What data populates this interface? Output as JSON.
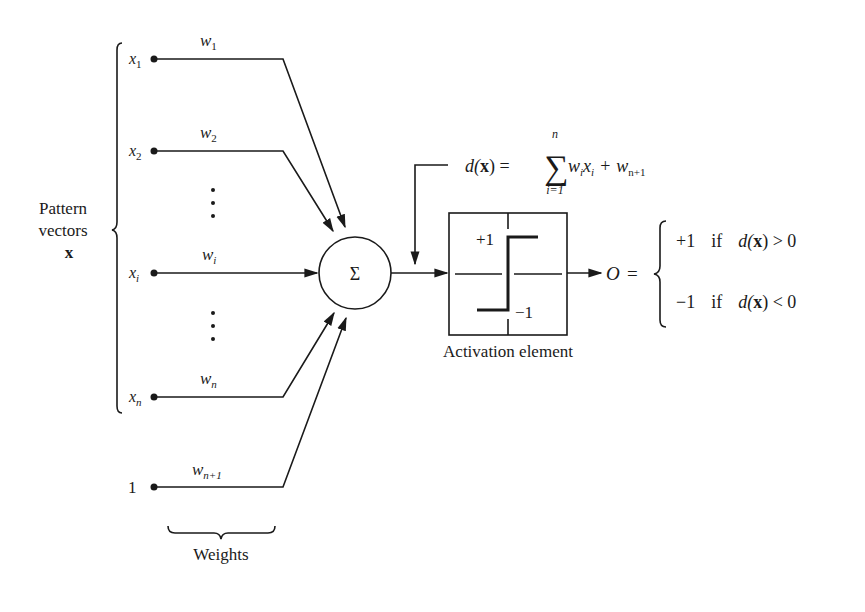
{
  "inputs": [
    {
      "var": "x",
      "sub": "1",
      "weight": "w",
      "weight_sub": "1"
    },
    {
      "var": "x",
      "sub": "2",
      "weight": "w",
      "weight_sub": "2"
    },
    {
      "var": "x",
      "sub": "i",
      "weight": "w",
      "weight_sub": "i"
    },
    {
      "var": "x",
      "sub": "n",
      "weight": "w",
      "weight_sub": "n"
    },
    {
      "var": "1",
      "sub": "",
      "weight": "w",
      "weight_sub": "n+1"
    }
  ],
  "ellipsis": "⋮",
  "pattern_label": {
    "line1": "Pattern",
    "line2": "vectors",
    "symbol": "x"
  },
  "weights_label": "Weights",
  "summation_symbol": "Σ",
  "decision_function": {
    "lhs": "d(",
    "lhs_bold": "x",
    "lhs_close": ") =",
    "sum_symbol": "∑",
    "sum_upper": "n",
    "sum_lower": "i=1",
    "term1": "w",
    "term1_sub": "i",
    "term1_b": "x",
    "term1_b_sub": "i",
    "plus": "+",
    "term2": "w",
    "term2_sub": "n+1"
  },
  "activation": {
    "label": "Activation element",
    "plus_one": "+1",
    "minus_one": "−1"
  },
  "output": {
    "symbol": "O",
    "equals": "=",
    "cases": [
      {
        "value": "+1",
        "cond": "if",
        "lhs": "d(",
        "bold": "x",
        "rel": ") > 0"
      },
      {
        "value": "−1",
        "cond": "if",
        "lhs": "d(",
        "bold": "x",
        "rel": ") < 0"
      }
    ]
  },
  "colors": {
    "ink": "#1a1a1a",
    "background": "#ffffff"
  }
}
